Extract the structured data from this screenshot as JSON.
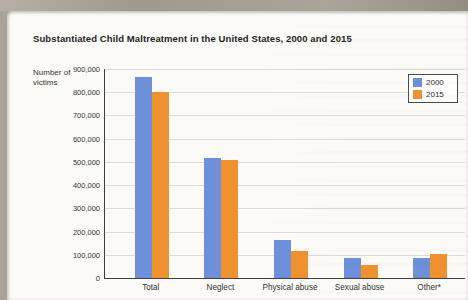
{
  "page": {
    "title": "Substantiated Child Maltreatment in the United States, 2000 and 2015",
    "caption": "Data from U.S. Department of Health and Human Services, December 31, 2000, p. 24, and January 19, 2017, p. 45."
  },
  "chart_data": {
    "type": "bar",
    "title": "Substantiated Child Maltreatment in the United States, 2000 and 2015",
    "ylabel": "Number of victims",
    "ylabel_lines": [
      "Number of",
      "victims"
    ],
    "xlabel": "",
    "categories": [
      "Total",
      "Neglect",
      "Physical abuse",
      "Sexual abuse",
      "Other*"
    ],
    "series": [
      {
        "name": "2000",
        "color": "#6e8fd9",
        "values": [
          865000,
          515000,
          165000,
          87000,
          85000
        ]
      },
      {
        "name": "2015",
        "color": "#f0912f",
        "values": [
          800000,
          510000,
          115000,
          57000,
          105000
        ]
      }
    ],
    "ylim": [
      0,
      900000
    ],
    "ytick_step": 100000,
    "yticks": [
      "0",
      "100,000",
      "200,000",
      "300,000",
      "400,000",
      "500,000",
      "600,000",
      "700,000",
      "800,000",
      "900,000"
    ],
    "grid": true,
    "legend_position": "top-right"
  }
}
